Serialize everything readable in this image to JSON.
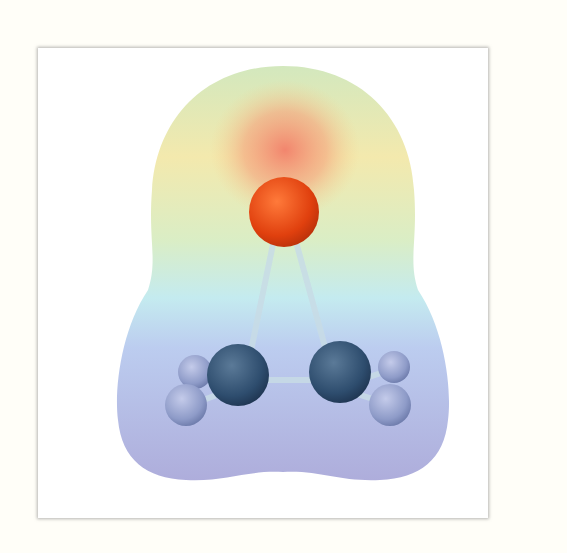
{
  "figure": {
    "atoms": [
      {
        "element": "O",
        "color": "#e0400e"
      },
      {
        "element": "C",
        "color": "#2e4d6e"
      },
      {
        "element": "C",
        "color": "#2e4d6e"
      },
      {
        "element": "H",
        "color": "#8e9bc8"
      },
      {
        "element": "H",
        "color": "#8e9bc8"
      },
      {
        "element": "H",
        "color": "#8e9bc8"
      },
      {
        "element": "H",
        "color": "#8e9bc8"
      }
    ],
    "surface_colors": {
      "negative": "#f08a6a",
      "mid_high": "#f4ee9a",
      "neutral": "#c8e2b0",
      "mid_low": "#b8e6ee",
      "positive": "#a9a8dc"
    }
  }
}
